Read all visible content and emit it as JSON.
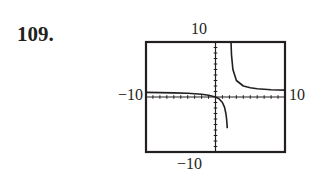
{
  "problem": {
    "number": "109."
  },
  "labels": {
    "ymax": "10",
    "ymin": "−10",
    "xmin": "−10",
    "xmax": "10"
  },
  "chart_data": {
    "type": "line",
    "title": "",
    "xlabel": "",
    "ylabel": "",
    "xlim": [
      -10,
      10
    ],
    "ylim": [
      -10,
      10
    ],
    "grid": false,
    "axes_ticks": "unit tick marks along both axes",
    "function_note": "rational function with vertical asymptote near x = 2 and horizontal asymptote near y = 1",
    "series": [
      {
        "name": "left branch",
        "x": [
          -10,
          -8,
          -6,
          -4,
          -2,
          -1,
          0,
          0.5,
          1,
          1.3,
          1.5,
          1.6,
          1.7
        ],
        "y": [
          0.83,
          0.8,
          0.75,
          0.67,
          0.5,
          0.33,
          0,
          -0.33,
          -1,
          -1.86,
          -3,
          -4,
          -5.67
        ]
      },
      {
        "name": "right branch",
        "x": [
          2.2,
          2.3,
          2.5,
          3,
          4,
          5,
          6,
          8,
          10
        ],
        "y": [
          11,
          7.67,
          5,
          3,
          2,
          1.67,
          1.5,
          1.33,
          1.25
        ]
      }
    ]
  }
}
